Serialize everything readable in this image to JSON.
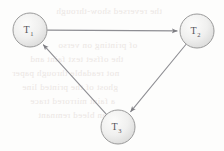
{
  "figure": {
    "name": "directed-cycle-diagram",
    "background_color": "#fdfdfc",
    "width": 224,
    "height": 151
  },
  "graph": {
    "type": "directed-cycle",
    "node_style": {
      "fill_light": "#fbfbfa",
      "fill_mid": "#ececec",
      "fill_edge": "#d8d8d8",
      "stroke_color": "#9a9a9a",
      "radius": 17
    },
    "edge_style": {
      "stroke_color": "#8e8e93",
      "stroke_width": 1.1,
      "arrow_color": "#7d7d82"
    },
    "nodes": [
      {
        "id": "T1",
        "label_base": "T",
        "label_sub": "1",
        "cx": 30,
        "cy": 30,
        "r": 17
      },
      {
        "id": "T2",
        "label_base": "T",
        "label_sub": "2",
        "cx": 197,
        "cy": 31,
        "r": 17
      },
      {
        "id": "T3",
        "label_base": "T",
        "label_sub": "3",
        "cx": 118,
        "cy": 127,
        "r": 17
      }
    ],
    "edges": [
      {
        "id": "edge-t1-t2",
        "from": "T1",
        "to": "T2",
        "directed": true,
        "label": ""
      },
      {
        "id": "edge-t2-t3",
        "from": "T2",
        "to": "T3",
        "directed": true,
        "label": ""
      },
      {
        "id": "edge-t3-t1",
        "from": "T3",
        "to": "T1",
        "directed": true,
        "label": ""
      }
    ]
  },
  "background_ghost_text": {
    "description": "faint mirrored bleed-through text from reverse page",
    "lines": [
      {
        "text": "the reversed show-through",
        "x": 56,
        "y": 6
      },
      {
        "text": "of printing on verso",
        "x": 58,
        "y": 40
      },
      {
        "text": "the offset text faint and",
        "x": 30,
        "y": 54
      },
      {
        "text": "not readable through paper",
        "x": 12,
        "y": 68
      },
      {
        "text": "ghost of the printed line",
        "x": 22,
        "y": 82
      },
      {
        "text": "a faint mirrored trace",
        "x": 30,
        "y": 96
      },
      {
        "text": "scan bleed remnant",
        "x": 38,
        "y": 110
      }
    ]
  }
}
